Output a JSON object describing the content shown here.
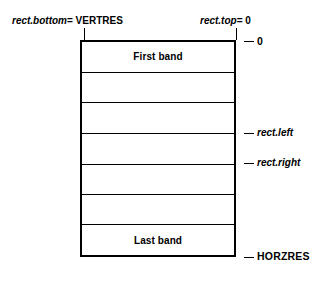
{
  "figure": {
    "background_color": "#ffffff",
    "line_color": "#000000"
  },
  "annotations": {
    "top_left": {
      "variable": "rect.bottom",
      "assignment": "= VERTRES"
    },
    "top_right": {
      "variable": "rect.top",
      "assignment": "= 0"
    },
    "right_ticks": [
      {
        "name": "zero",
        "label": "0",
        "italic": false
      },
      {
        "name": "rect-left",
        "label": "rect.left",
        "italic": true
      },
      {
        "name": "rect-right",
        "label": "rect.right",
        "italic": true
      },
      {
        "name": "horzres",
        "label": "HORZRES",
        "italic": false
      }
    ]
  },
  "rectangle": {
    "bands": [
      {
        "label": "First band"
      },
      {
        "label": ""
      },
      {
        "label": ""
      },
      {
        "label": ""
      },
      {
        "label": ""
      },
      {
        "label": ""
      },
      {
        "label": "Last band"
      }
    ]
  }
}
